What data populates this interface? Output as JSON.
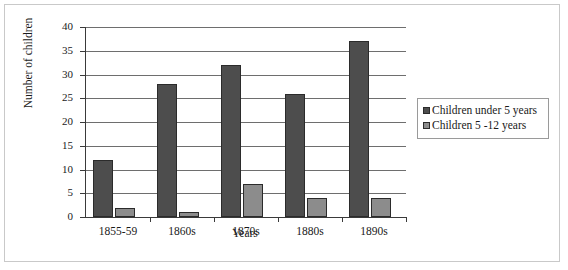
{
  "chart_data": {
    "type": "bar",
    "title": "",
    "xlabel": "Years",
    "ylabel": "Number of children",
    "categories": [
      "1855-59",
      "1860s",
      "1870s",
      "1880s",
      "1890s"
    ],
    "series": [
      {
        "name": "Children under 5 years",
        "values": [
          12,
          28,
          32,
          26,
          37
        ],
        "color": "#4d4d4d"
      },
      {
        "name": "Children 5 -12 years",
        "values": [
          2,
          1,
          7,
          4,
          4
        ],
        "color": "#8c8c8c"
      }
    ],
    "ylim": [
      0,
      40
    ],
    "ytick_labels": [
      "40",
      "35",
      "30",
      "25",
      "20",
      "15",
      "10",
      "5",
      "0"
    ],
    "ytick_values": [
      40,
      35,
      30,
      25,
      20,
      15,
      10,
      5,
      0
    ],
    "grid": true,
    "legend_position": "right"
  },
  "legend": {
    "items": [
      {
        "label": "Children under 5 years"
      },
      {
        "label": "Children 5 -12 years"
      }
    ]
  }
}
